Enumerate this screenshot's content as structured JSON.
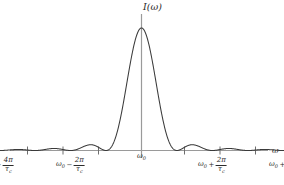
{
  "chart_data": {
    "type": "line",
    "title": "",
    "subtitle": "",
    "xlabel": "ω",
    "ylabel": "I(ω)",
    "grid": false,
    "legend": null,
    "function": "I(ω) ∝ sinc^2[(ω - ω₀)τ_c/2]",
    "xlim": [
      -5.6,
      5.6
    ],
    "ylim": [
      0,
      1.08
    ],
    "x_unit": "2π/τ_c",
    "peak": {
      "x": 0,
      "y": 1.0,
      "label": "ω₀"
    },
    "zeros": [
      -4,
      -3,
      -2,
      -1,
      1,
      2,
      3,
      4
    ],
    "side_lobe_peaks": [
      {
        "x": -4.5,
        "y": 0.0047
      },
      {
        "x": -3.47,
        "y": 0.0083
      },
      {
        "x": -2.46,
        "y": 0.0165
      },
      {
        "x": -1.43,
        "y": 0.0472
      },
      {
        "x": 1.43,
        "y": 0.0472
      },
      {
        "x": 2.46,
        "y": 0.0165
      },
      {
        "x": 3.47,
        "y": 0.0083
      },
      {
        "x": 4.5,
        "y": 0.0047
      }
    ],
    "x_ticks": [
      {
        "x": -4,
        "label_parts": {
          "base": "ω",
          "sub": "0",
          "op": "−",
          "num": "4π",
          "den_base": "τ",
          "den_sub": "c"
        }
      },
      {
        "x": -2,
        "label_parts": {
          "base": "ω",
          "sub": "0",
          "op": "−",
          "num": "2π",
          "den_base": "τ",
          "den_sub": "c"
        }
      },
      {
        "x": 0,
        "label_parts": {
          "base": "ω",
          "sub": "0",
          "op": "",
          "num": "",
          "den_base": "",
          "den_sub": ""
        }
      },
      {
        "x": 2,
        "label_parts": {
          "base": "ω",
          "sub": "0",
          "op": "+",
          "num": "2π",
          "den_base": "τ",
          "den_sub": "c"
        }
      },
      {
        "x": 4,
        "label_parts": {
          "base": "ω",
          "sub": "0",
          "op": "+",
          "num": "4π",
          "den_base": "τ",
          "den_sub": "c"
        }
      }
    ],
    "unlabeled_tick_positions": [
      -5,
      -1,
      1,
      5
    ],
    "colors": {
      "curve": "#3a3a3a",
      "axis": "#9a9a9a",
      "tick": "#6e6e6e",
      "text": "#2b2b2b",
      "background": "#ffffff"
    }
  }
}
